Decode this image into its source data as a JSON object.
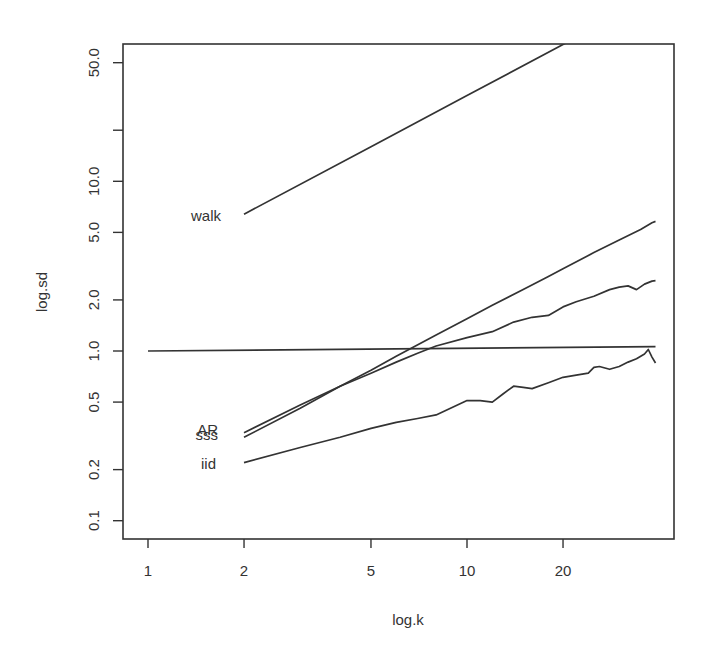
{
  "chart_data": {
    "type": "line",
    "title": "",
    "xlabel": "log.k",
    "ylabel": "log.sd",
    "xscale": "log",
    "yscale": "log",
    "xlim": [
      0.93,
      45
    ],
    "ylim": [
      0.085,
      65
    ],
    "grid": false,
    "legend": "none (series labeled directly at left ends)",
    "x_ticks": [
      1,
      2,
      5,
      10,
      20
    ],
    "x_tick_labels": [
      "1",
      "2",
      "5",
      "10",
      "20"
    ],
    "y_ticks": [
      0.1,
      0.2,
      0.5,
      1.0,
      2.0,
      5.0,
      10.0,
      20.0,
      50.0
    ],
    "y_tick_labels": [
      "0.1",
      "0.2",
      "0.5",
      "1.0",
      "2.0",
      "5.0",
      "10.0",
      "",
      "50.0"
    ],
    "series": [
      {
        "name": "walk",
        "label": "walk",
        "x": [
          2,
          5,
          10,
          20,
          22
        ],
        "values": [
          6.4,
          16,
          32,
          64,
          70
        ]
      },
      {
        "name": "reference",
        "label": "",
        "x": [
          1,
          39
        ],
        "values": [
          1.0,
          1.06
        ]
      },
      {
        "name": "sss",
        "label": "sss",
        "x": [
          2,
          3,
          4,
          5,
          6,
          8,
          10,
          12,
          15,
          18,
          20,
          25,
          30,
          35,
          38,
          39
        ],
        "values": [
          0.31,
          0.46,
          0.62,
          0.77,
          0.93,
          1.24,
          1.55,
          1.86,
          2.3,
          2.75,
          3.05,
          3.8,
          4.5,
          5.2,
          5.7,
          5.8
        ]
      },
      {
        "name": "AR",
        "label": "AR",
        "x": [
          2,
          3,
          4,
          5,
          6,
          7,
          8,
          10,
          12,
          14,
          16,
          18,
          20,
          22,
          25,
          28,
          30,
          32,
          34,
          36,
          38,
          39
        ],
        "values": [
          0.33,
          0.48,
          0.62,
          0.74,
          0.86,
          0.97,
          1.07,
          1.2,
          1.3,
          1.48,
          1.58,
          1.62,
          1.82,
          1.95,
          2.1,
          2.3,
          2.38,
          2.42,
          2.3,
          2.48,
          2.58,
          2.6
        ]
      },
      {
        "name": "iid",
        "label": "iid",
        "x": [
          2,
          3,
          4,
          5,
          6,
          7,
          8,
          10,
          11,
          12,
          13,
          14,
          15,
          16,
          18,
          20,
          22,
          24,
          25,
          26,
          28,
          30,
          32,
          34,
          36,
          37,
          38,
          39
        ],
        "values": [
          0.22,
          0.27,
          0.31,
          0.35,
          0.38,
          0.4,
          0.42,
          0.51,
          0.51,
          0.5,
          0.56,
          0.62,
          0.61,
          0.6,
          0.65,
          0.7,
          0.72,
          0.74,
          0.8,
          0.81,
          0.78,
          0.81,
          0.86,
          0.9,
          0.96,
          1.02,
          0.92,
          0.85
        ]
      }
    ],
    "annotations": [
      "walk",
      "AR",
      "sss",
      "iid"
    ]
  },
  "axes": {
    "xlabel": "log.k",
    "ylabel": "log.sd"
  },
  "labels": {
    "walk": "walk",
    "ar": "AR",
    "sss": "sss",
    "iid": "iid"
  }
}
